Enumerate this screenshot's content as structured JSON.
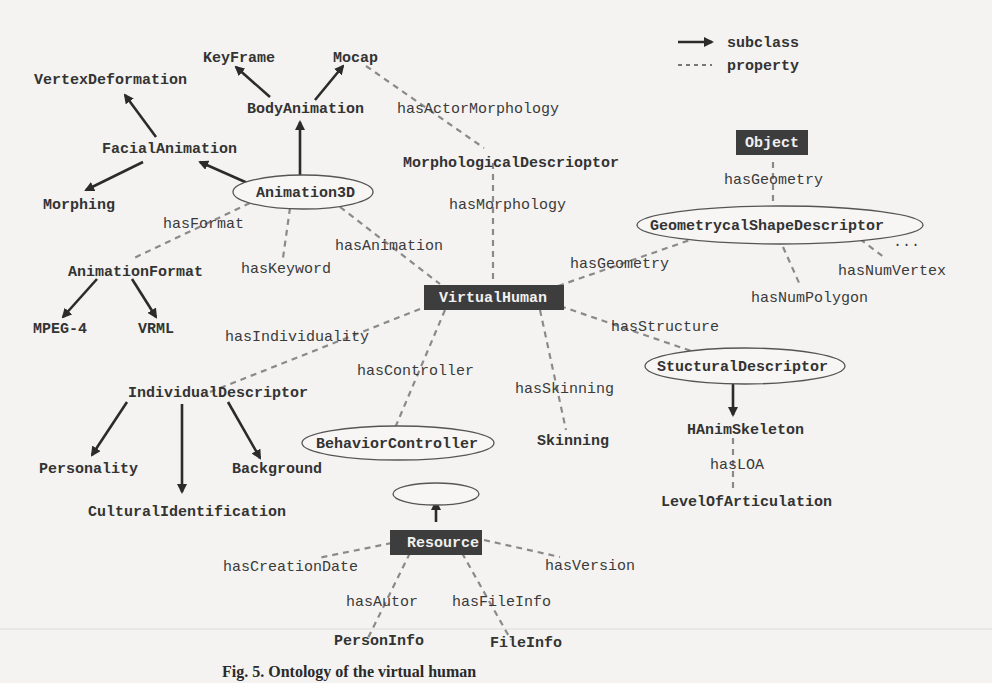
{
  "legend": {
    "subclass_label": "subclass",
    "property_label": "property"
  },
  "classes": {
    "keyframe": "KeyFrame",
    "mocap": "Mocap",
    "vertex_deformation": "VertexDeformation",
    "body_animation": "BodyAnimation",
    "facial_animation": "FacialAnimation",
    "morphing": "Morphing",
    "animation3d": "Animation3D",
    "animation_format": "AnimationFormat",
    "mpeg4": "MPEG-4",
    "vrml": "VRML",
    "morphological_descriptor": "MorphologicalDescrioptor",
    "virtual_human": "VirtualHuman",
    "object": "Object",
    "geometrical_shape_descriptor": "GeometrycalShapeDescriptor",
    "individual_descriptor": "IndividualDescriptor",
    "personality": "Personality",
    "background": "Background",
    "cultural_identification": "CulturalIdentification",
    "behavior_controller": "BehaviorController",
    "skinning": "Skinning",
    "structural_descriptor": "StucturalDescriptor",
    "hanim_skeleton": "HAnimSkeleton",
    "level_of_articulation": "LevelOfArticulation",
    "resource": "Resource",
    "person_info": "PersonInfo",
    "file_info": "FileInfo"
  },
  "properties": {
    "has_actor_morphology": "hasActorMorphology",
    "has_morphology": "hasMorphology",
    "has_format": "hasFormat",
    "has_keyword": "hasKeyword",
    "has_animation": "hasAnimation",
    "has_geometry_vh": "hasGeometry",
    "has_geometry_obj": "hasGeometry",
    "has_num_vertex": "hasNumVertex",
    "has_num_polygon": "hasNumPolygon",
    "ellipsis": "...",
    "has_individuality": "hasIndividuality",
    "has_controller": "hasController",
    "has_skinning": "hasSkinning",
    "has_structure": "hasStructure",
    "has_loa": "hasLOA",
    "has_creation_date": "hasCreationDate",
    "has_version": "hasVersion",
    "has_autor": "hasAutor",
    "has_file_info": "hasFileInfo"
  },
  "caption": "Fig. 5. Ontology of the virtual human"
}
